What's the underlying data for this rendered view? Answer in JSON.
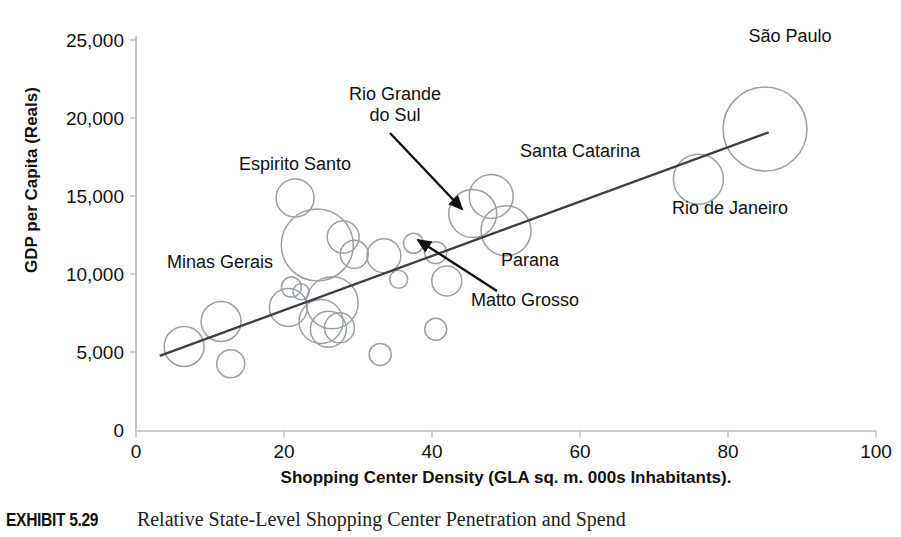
{
  "chart_data": {
    "type": "scatter",
    "title": "Relative State-Level Shopping Center Penetration and Spend",
    "xlabel": "Shopping Center Density (GLA sq. m. 000s Inhabitants).",
    "ylabel": "GDP per Capita (Reals)",
    "xlim": [
      0,
      100
    ],
    "ylim": [
      0,
      25000
    ],
    "xticks": [
      "0",
      "20",
      "40",
      "60",
      "80",
      "100"
    ],
    "yticks": [
      "0",
      "5,000",
      "10,000",
      "15,000",
      "20,000",
      "25,000"
    ],
    "grid": false,
    "legend": "none",
    "bubble_note": "Bubble area encodes state size; outlines only, no fill",
    "trendline": {
      "x0": 3.2,
      "y0": 4800,
      "x1": 85.5,
      "y1": 19100
    },
    "points": [
      {
        "label": "Sao Paulo",
        "x": 85.0,
        "y": 19300,
        "r": 42
      },
      {
        "label": "Rio de Janeiro",
        "x": 76.0,
        "y": 16100,
        "r": 25
      },
      {
        "label": "Santa Catarina",
        "x": 48.0,
        "y": 15000,
        "r": 22
      },
      {
        "label": "Rio Grande do Sul",
        "x": 45.5,
        "y": 13900,
        "r": 24
      },
      {
        "label": "Parana",
        "x": 50.0,
        "y": 12800,
        "r": 25
      },
      {
        "label": "Espirito Santo",
        "x": 21.5,
        "y": 14900,
        "r": 19
      },
      {
        "label": "Matto Grosso",
        "x": 37.5,
        "y": 12000,
        "r": 10
      },
      {
        "label": "",
        "x": 24.5,
        "y": 11900,
        "r": 36
      },
      {
        "label": "",
        "x": 28.0,
        "y": 12400,
        "r": 16
      },
      {
        "label": "",
        "x": 29.5,
        "y": 11300,
        "r": 14
      },
      {
        "label": "",
        "x": 33.5,
        "y": 11200,
        "r": 17
      },
      {
        "label": "",
        "x": 40.5,
        "y": 11400,
        "r": 11
      },
      {
        "label": "",
        "x": 42.0,
        "y": 9600,
        "r": 15
      },
      {
        "label": "",
        "x": 21.0,
        "y": 9200,
        "r": 10
      },
      {
        "label": "",
        "x": 22.3,
        "y": 8900,
        "r": 8
      },
      {
        "label": "",
        "x": 20.6,
        "y": 7900,
        "r": 19
      },
      {
        "label": "",
        "x": 26.5,
        "y": 8200,
        "r": 26
      },
      {
        "label": "",
        "x": 25.0,
        "y": 7000,
        "r": 22
      },
      {
        "label": "",
        "x": 26.0,
        "y": 6500,
        "r": 18
      },
      {
        "label": "",
        "x": 27.5,
        "y": 6600,
        "r": 15
      },
      {
        "label": "",
        "x": 35.5,
        "y": 9700,
        "r": 9
      },
      {
        "label": "",
        "x": 40.5,
        "y": 6500,
        "r": 11
      },
      {
        "label": "",
        "x": 11.5,
        "y": 7000,
        "r": 20
      },
      {
        "label": "",
        "x": 6.5,
        "y": 5400,
        "r": 20
      },
      {
        "label": "",
        "x": 12.8,
        "y": 4300,
        "r": 14
      },
      {
        "label": "",
        "x": 33.0,
        "y": 4900,
        "r": 11
      }
    ],
    "annotations": [
      {
        "label": "Rio Grande\ndo Sul",
        "kind": "arrow-label"
      },
      {
        "label": "Matto Grosso",
        "kind": "arrow-label"
      },
      {
        "label": "Sao Paulo",
        "kind": "plain-label"
      },
      {
        "label": "Rio de Janeiro",
        "kind": "plain-label"
      },
      {
        "label": "Santa Catarina",
        "kind": "plain-label"
      },
      {
        "label": "Parana",
        "kind": "plain-label"
      },
      {
        "label": "Espirito Santo",
        "kind": "plain-label"
      },
      {
        "label": "Minas Gerais",
        "kind": "plain-label"
      }
    ]
  },
  "axis": {
    "y_title": "GDP per Capita (Reals)",
    "x_title": "Shopping Center Density (GLA sq. m. 000s Inhabitants).",
    "y_ticks": {
      "t0": "0",
      "t1": "5,000",
      "t2": "10,000",
      "t3": "15,000",
      "t4": "20,000",
      "t5": "25,000"
    },
    "x_ticks": {
      "t0": "0",
      "t1": "20",
      "t2": "40",
      "t3": "60",
      "t4": "80",
      "t5": "100"
    }
  },
  "labels": {
    "sao_paulo": "São Paulo",
    "rio_de_janeiro": "Rio de Janeiro",
    "santa_catarina": "Santa Catarina",
    "rio_grande_do_sul_line1": "Rio Grande",
    "rio_grande_do_sul_line2": "do Sul",
    "parana": "Parana",
    "espirito_santo": "Espirito Santo",
    "minas_gerais": "Minas Gerais",
    "matto_grosso": "Matto Grosso"
  },
  "caption": {
    "tag": "EXHIBIT 5.29",
    "text": "Relative State-Level Shopping Center Penetration and Spend"
  },
  "colors": {
    "bubble_stroke": "#9aa0a6",
    "axis": "#b9bcc0",
    "trendline": "#3b3f44",
    "text": "#111111",
    "background": "#ffffff"
  }
}
